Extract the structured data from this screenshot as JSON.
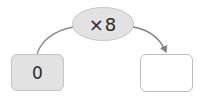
{
  "diagram": {
    "type": "function-machine",
    "operator": {
      "label": "×8",
      "fill": "#e2e2e2"
    },
    "input": {
      "value": "0",
      "fill": "#e2e2e2"
    },
    "output": {
      "value": "",
      "fill": "#ffffff"
    },
    "connector_color": "#808080",
    "arrow_direction": "input-to-output"
  }
}
